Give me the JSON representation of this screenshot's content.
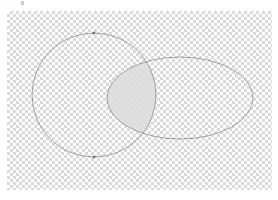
{
  "app": {
    "surface": "vector-canvas",
    "background": "#ffffff"
  },
  "toolbar": {
    "residual_glyphs": "....",
    "dot_color": "#c9c9cf"
  },
  "artboard": {
    "label": "transparent-canvas",
    "x": 7,
    "y": 11,
    "width": 265,
    "height": 179,
    "checker_light": "#ffffff",
    "checker_dark": "#d9d9de",
    "checker_cell": 3
  },
  "shapes": {
    "stroke_color": "#8d8d95",
    "stroke_width": 0.8,
    "fill": "none",
    "circle": {
      "name": "circle",
      "cx": 94,
      "cy": 95,
      "r": 62,
      "label": "Circle"
    },
    "ellipse": {
      "name": "ellipse",
      "cx": 180,
      "cy": 98,
      "rx": 73,
      "ry": 41,
      "label": "Ellipse"
    },
    "intersection": {
      "name": "intersection-region",
      "fill_color": "#dcdcdf",
      "fill_opacity": 0.85,
      "label": "Intersection"
    }
  },
  "nodes": {
    "marker_color": "#6f6f77",
    "items": [
      {
        "name": "node-top",
        "cx": 94,
        "cy": 33
      },
      {
        "name": "node-bottom",
        "cx": 94,
        "cy": 157
      }
    ]
  }
}
